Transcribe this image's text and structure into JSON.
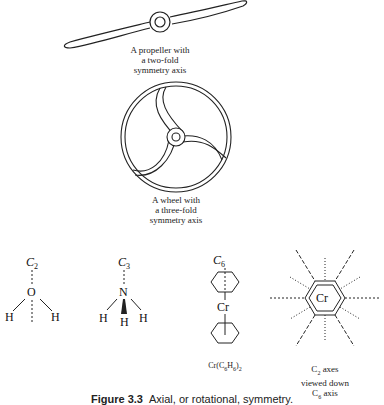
{
  "figure": {
    "number": "Figure 3.3",
    "caption": "Axial, or rotational, symmetry."
  },
  "propeller": {
    "caption_lines": [
      "A propeller with",
      "a two-fold",
      "symmetry axis"
    ]
  },
  "wheel": {
    "caption_lines": [
      "A wheel with",
      "a three-fold",
      "symmetry axis"
    ]
  },
  "water": {
    "axis_label": "C",
    "axis_sub": "2",
    "central_atom": "O",
    "h_left": "H",
    "h_right": "H"
  },
  "ammonia": {
    "axis_label": "C",
    "axis_sub": "3",
    "central_atom": "N",
    "h_left": "H",
    "h_middle": "H",
    "h_right": "H"
  },
  "dibenzene_chromium": {
    "axis_label": "C",
    "axis_sub": "6",
    "metal": "Cr",
    "formula_prefix": "Cr(C",
    "formula_sub1": "6",
    "formula_mid": "H",
    "formula_sub2": "6",
    "formula_suffix": ")",
    "formula_sub3": "2"
  },
  "top_view": {
    "metal": "Cr",
    "caption_line1_prefix": "C",
    "caption_line1_sub": "2",
    "caption_line1_suffix": " axes",
    "caption_line2": "viewed down",
    "caption_line3_prefix": "C",
    "caption_line3_sub": "6",
    "caption_line3_suffix": " axis"
  }
}
